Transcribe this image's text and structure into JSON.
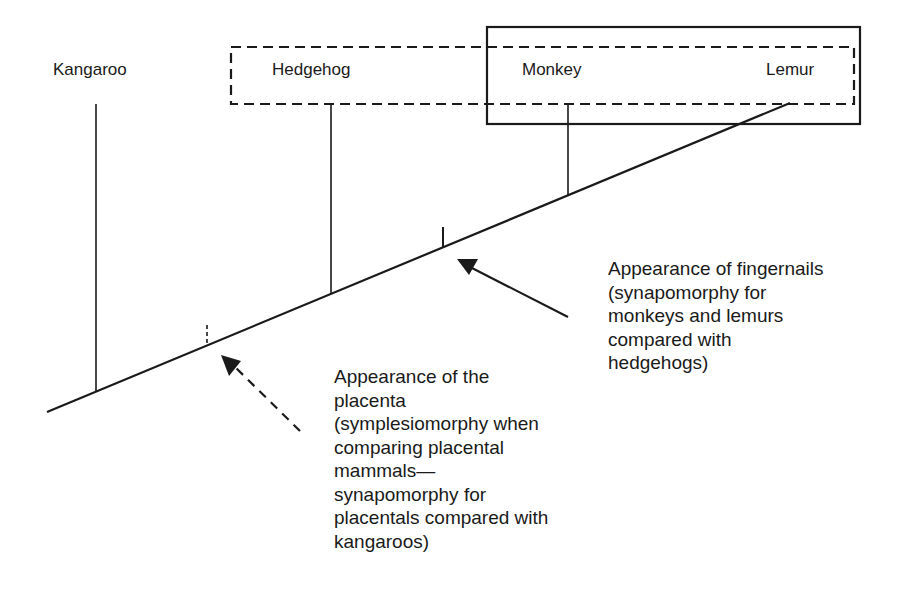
{
  "taxa": [
    {
      "name": "Kangaroo"
    },
    {
      "name": "Hedgehog"
    },
    {
      "name": "Monkey"
    },
    {
      "name": "Lemur"
    }
  ],
  "annotations": {
    "fingernails": "Appearance of fingernails\n(synapomorphy for\nmonkeys and lemurs\ncompared with\nhedgehogs)",
    "placenta": "Appearance of the\nplacenta\n(symplesiomorphy when\ncomparing placental\nmammals—\nsynapomorphy for\nplacentals compared with\nkangaroos)"
  },
  "groups": {
    "dashed_group": [
      "Hedgehog",
      "Monkey",
      "Lemur"
    ],
    "solid_group": [
      "Monkey",
      "Lemur"
    ]
  },
  "colors": {
    "line": "#1a1a1a",
    "background": "#ffffff"
  }
}
